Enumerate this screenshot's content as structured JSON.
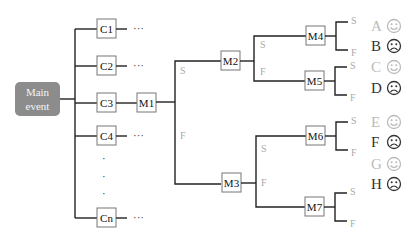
{
  "main_event": {
    "line1": "Main",
    "line2": "event"
  },
  "causes": [
    {
      "label": "C1",
      "trail": "···"
    },
    {
      "label": "C2",
      "trail": "···"
    },
    {
      "label": "C3",
      "trail": ""
    },
    {
      "label": "C4",
      "trail": "···"
    },
    {
      "label": "Cn",
      "trail": "···"
    }
  ],
  "vertical_ellipsis": "·",
  "modules": [
    "M1",
    "M2",
    "M3",
    "M4",
    "M5",
    "M6",
    "M7"
  ],
  "branch_labels": {
    "success": "S",
    "failure": "F"
  },
  "outcomes": [
    {
      "letter": "A",
      "result": "success",
      "face": "smiley-icon"
    },
    {
      "letter": "B",
      "result": "failure",
      "face": "frown-icon"
    },
    {
      "letter": "C",
      "result": "success",
      "face": "smiley-icon"
    },
    {
      "letter": "D",
      "result": "failure",
      "face": "frown-icon"
    },
    {
      "letter": "E",
      "result": "success",
      "face": "smiley-icon"
    },
    {
      "letter": "F",
      "result": "failure",
      "face": "frown-icon"
    },
    {
      "letter": "G",
      "result": "success",
      "face": "smiley-icon"
    },
    {
      "letter": "H",
      "result": "failure",
      "face": "frown-icon"
    }
  ],
  "colors": {
    "main_fill": "#8c8c8c",
    "success_gray": "#bbbbbb",
    "failure_dark": "#333333"
  }
}
